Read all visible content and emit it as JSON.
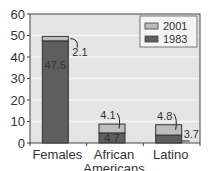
{
  "chart_data": {
    "type": "bar",
    "stacked": true,
    "title": "",
    "xlabel": "",
    "ylabel": "",
    "ylim": [
      0,
      60
    ],
    "yticks": [
      0,
      10,
      20,
      30,
      40,
      50,
      60
    ],
    "grid": true,
    "legend_position": "top-right",
    "categories": [
      "Females",
      "African Americans",
      "Latino"
    ],
    "category_lines": [
      [
        "Females"
      ],
      [
        "African",
        "Americans"
      ],
      [
        "Latino"
      ]
    ],
    "series": [
      {
        "name": "1983",
        "values": [
          47.5,
          4.7,
          3.7
        ],
        "color": "#5e5e5e"
      },
      {
        "name": "2001",
        "values": [
          2.1,
          4.1,
          4.8
        ],
        "color": "#bdbdbd"
      }
    ],
    "legend": [
      {
        "label": "2001",
        "color": "#bdbdbd"
      },
      {
        "label": "1983",
        "color": "#5e5e5e"
      }
    ],
    "data_labels": {
      "1983": [
        "47.5",
        "4.7",
        "3.7"
      ],
      "2001": [
        "2.1",
        "4.1",
        "4.8"
      ]
    },
    "colors": {
      "plot_bg": "#e4e4e4",
      "grid": "#f5f5f5",
      "axis": "#444444"
    }
  }
}
